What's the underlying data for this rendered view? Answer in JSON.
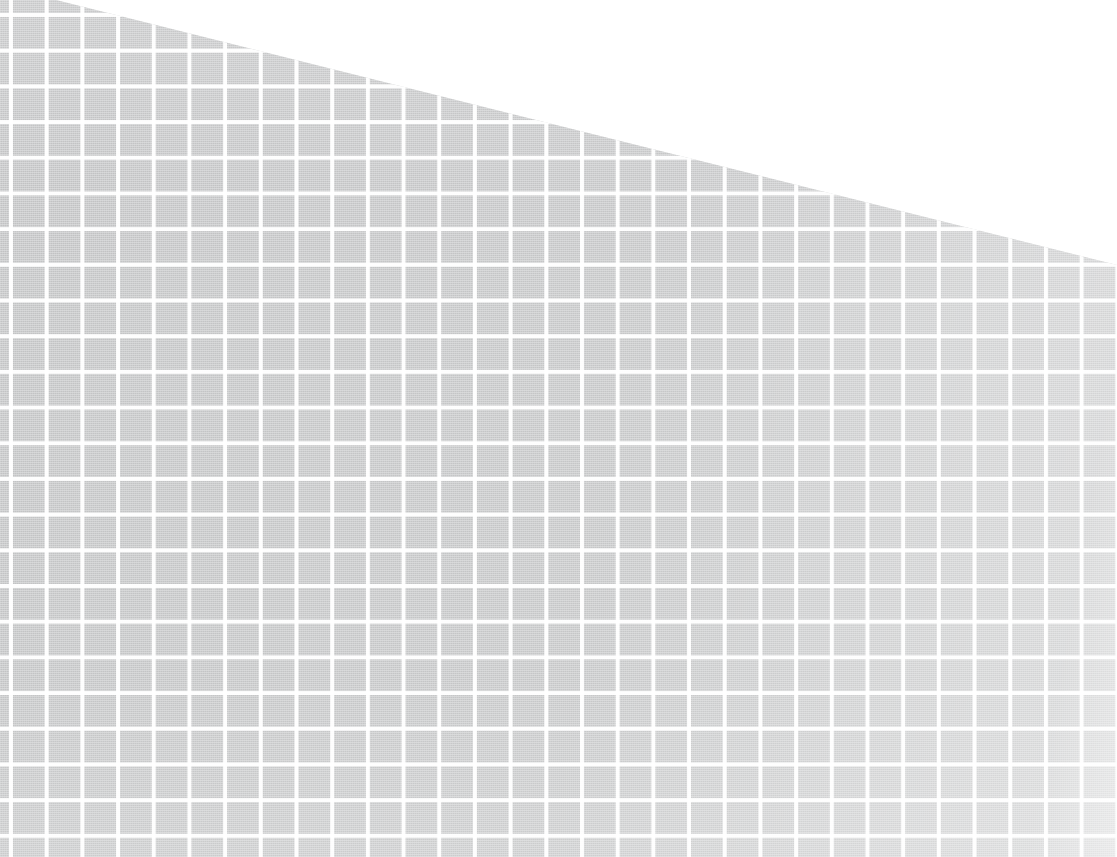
{
  "scene": {
    "name": "grid-paper-sheet",
    "description": "Scanned sheet of gray graph paper over a white background",
    "width": 1117,
    "height": 857
  },
  "colors": {
    "background": "#ffffff",
    "paper_fill": "#c9cacb",
    "rule_line": "#ffffff",
    "edge_shadow": "#787878"
  },
  "paper": {
    "grid": {
      "cell_size_px": 35.7,
      "line_width_px": 4,
      "origin_x_px": 9,
      "origin_y_px": 13,
      "columns": 32,
      "rows": 24
    },
    "outline_points": "56,0 1117,265 1117,857 0,857 0,0",
    "notch_vertex_x": 960,
    "notch_vertex_y": 425,
    "edge_top_left_x": 56,
    "edge_right_y": 265
  },
  "regions": {
    "white_upper": "upper-right white background wedge",
    "notch": "v-shaped white notch at right edge"
  }
}
